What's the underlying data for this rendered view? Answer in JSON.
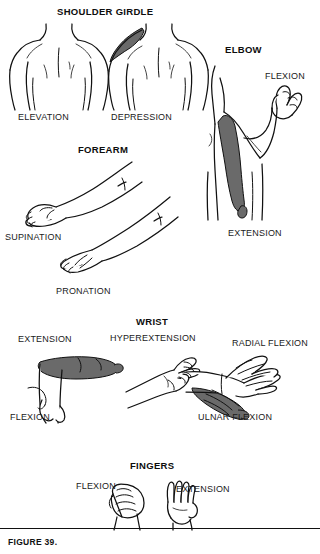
{
  "figure": {
    "caption": "FIGURE 39.",
    "ink_color": "#111111",
    "shade_color": "#6a6a6a",
    "background": "#ffffff"
  },
  "sections": [
    {
      "id": "shoulder-girdle",
      "title": "SHOULDER GIRDLE",
      "labels": [
        {
          "id": "elevation",
          "text": "ELEVATION"
        },
        {
          "id": "depression",
          "text": "DEPRESSION"
        }
      ]
    },
    {
      "id": "elbow",
      "title": "ELBOW",
      "labels": [
        {
          "id": "flexion",
          "text": "FLEXION"
        },
        {
          "id": "extension",
          "text": "EXTENSION"
        }
      ]
    },
    {
      "id": "forearm",
      "title": "FOREARM",
      "labels": [
        {
          "id": "supination",
          "text": "SUPINATION"
        },
        {
          "id": "pronation",
          "text": "PRONATION"
        }
      ]
    },
    {
      "id": "wrist",
      "title": "WRIST",
      "labels": [
        {
          "id": "extension",
          "text": "EXTENSION"
        },
        {
          "id": "flexion",
          "text": "FLEXION"
        },
        {
          "id": "hyperextension",
          "text": "HYPEREXTENSION"
        },
        {
          "id": "radial-flexion",
          "text": "RADIAL FLEXION"
        },
        {
          "id": "ulnar-flexion",
          "text": "ULNAR FLEXION"
        }
      ]
    },
    {
      "id": "fingers",
      "title": "FINGERS",
      "labels": [
        {
          "id": "flexion",
          "text": "FLEXION"
        },
        {
          "id": "extension",
          "text": "EXTENSION"
        }
      ]
    }
  ]
}
